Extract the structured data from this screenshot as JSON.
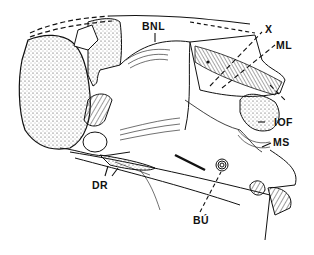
{
  "figure": {
    "type": "anatomical line drawing",
    "colors": {
      "ink": "#111111",
      "background": "#ffffff"
    },
    "labels": [
      {
        "id": "bnl",
        "text": "BNL",
        "x": 142,
        "y": 21
      },
      {
        "id": "x",
        "text": "X",
        "x": 265,
        "y": 24
      },
      {
        "id": "ml",
        "text": "ML",
        "x": 276,
        "y": 40
      },
      {
        "id": "iof",
        "text": "IOF",
        "x": 274,
        "y": 120
      },
      {
        "id": "ms",
        "text": "MS",
        "x": 273,
        "y": 139
      },
      {
        "id": "dr",
        "text": "DR",
        "x": 92,
        "y": 181
      },
      {
        "id": "bu",
        "text": "BÚ",
        "x": 193,
        "y": 217
      }
    ]
  }
}
